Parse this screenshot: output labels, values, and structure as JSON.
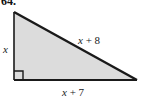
{
  "figure": {
    "problem_number": "64.",
    "shape": "right-triangle",
    "fill_color": "#dcdcdc",
    "stroke_color": "#1a1a1a",
    "background_color": "#ffffff",
    "vertices": {
      "apex_top_left": [
        14,
        12
      ],
      "right_angle_bottom_left": [
        14,
        80
      ],
      "bottom_right": [
        137,
        80
      ]
    },
    "right_angle_marker": {
      "present": true,
      "at_vertex": "bottom-left",
      "size": 9
    },
    "labels": {
      "leg_vertical": "x",
      "leg_base": "x + 7",
      "hypotenuse": "x + 8"
    }
  }
}
